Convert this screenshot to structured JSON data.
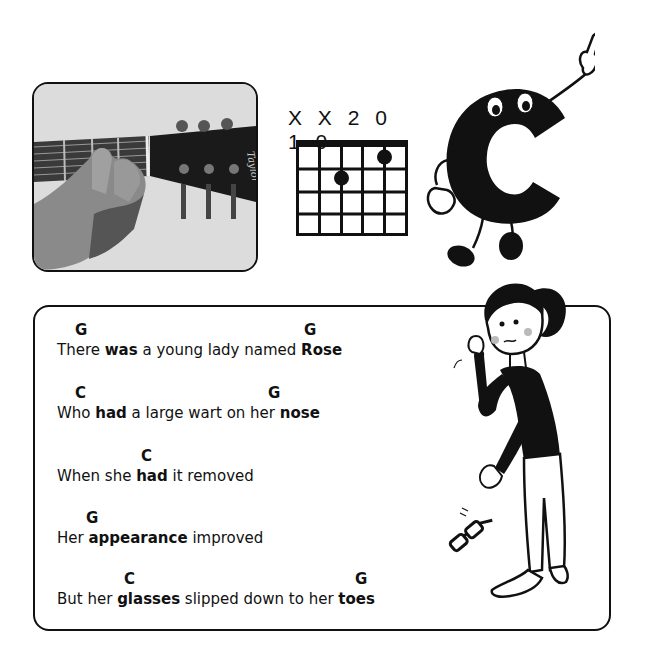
{
  "photo": {
    "alt": "Hand fretting a C chord on a guitar neck near the headstock",
    "headstock_brand": "Taylor"
  },
  "chord": {
    "name": "C",
    "fingering_label": "X X 2 0 1 0",
    "strings": 6,
    "frets_shown": 4,
    "dots": [
      {
        "string": 5,
        "fret": 1
      },
      {
        "string": 3,
        "fret": 2
      }
    ]
  },
  "mascot": {
    "letter": "C",
    "description": "Cartoon letter C with eyes, arms and legs, pointing up"
  },
  "lyrics": {
    "lines": [
      {
        "chords": [
          {
            "label": "G",
            "offset": 52
          },
          {
            "label": "G",
            "offset": 281
          }
        ],
        "parts": [
          {
            "text": "There ",
            "bold": false
          },
          {
            "text": "was",
            "bold": true
          },
          {
            "text": " a young lady named ",
            "bold": false
          },
          {
            "text": "Rose",
            "bold": true
          }
        ]
      },
      {
        "chords": [
          {
            "label": "C",
            "offset": 52
          },
          {
            "label": "G",
            "offset": 245
          }
        ],
        "parts": [
          {
            "text": "Who ",
            "bold": false
          },
          {
            "text": "had",
            "bold": true
          },
          {
            "text": " a large wart on her ",
            "bold": false
          },
          {
            "text": "nose",
            "bold": true
          }
        ]
      },
      {
        "chords": [
          {
            "label": "C",
            "offset": 85
          }
        ],
        "parts": [
          {
            "text": "When she ",
            "bold": false
          },
          {
            "text": "had",
            "bold": true
          },
          {
            "text": " it removed",
            "bold": false
          }
        ]
      },
      {
        "chords": [
          {
            "label": "G",
            "offset": 30
          }
        ],
        "parts": [
          {
            "text": "Her ",
            "bold": false
          },
          {
            "text": "appearance",
            "bold": true
          },
          {
            "text": " improved",
            "bold": false
          }
        ]
      },
      {
        "chords": [
          {
            "label": "C",
            "offset": 67
          },
          {
            "label": "G",
            "offset": 297
          }
        ],
        "parts": [
          {
            "text": "But her ",
            "bold": false
          },
          {
            "text": "glasses",
            "bold": true
          },
          {
            "text": " slipped down to her ",
            "bold": false
          },
          {
            "text": "toes",
            "bold": true
          }
        ]
      }
    ]
  },
  "illustration": {
    "description": "Cartoon girl with ponytail, glasses falling to her bare feet"
  }
}
